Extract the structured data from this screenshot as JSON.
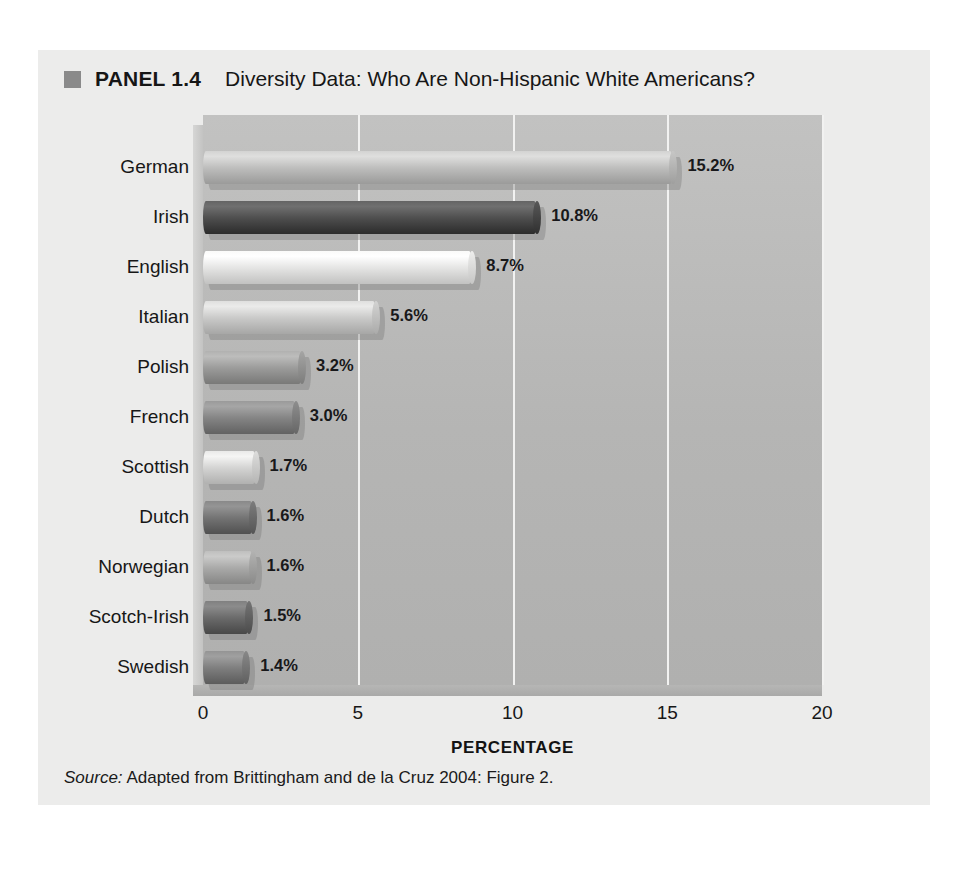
{
  "panel": {
    "bullet_icon": "square-bullet-icon",
    "label": "PANEL 1.4",
    "title": "Diversity Data: Who Are Non-Hispanic White Americans?",
    "source_prefix": "Source:",
    "source_text": " Adapted from Brittingham and de la Cruz 2004: Figure 2.",
    "background_color": "#ececeb",
    "bullet_color": "#8a8a8a"
  },
  "chart_data": {
    "type": "bar",
    "orientation": "horizontal",
    "title": "Diversity Data: Who Are Non-Hispanic White Americans?",
    "xlabel": "PERCENTAGE",
    "ylabel": "",
    "xlim": [
      0,
      20
    ],
    "xticks": [
      0,
      5,
      10,
      15,
      20
    ],
    "xtick_labels": [
      "0",
      "5",
      "10",
      "15",
      "20"
    ],
    "grid": true,
    "legend": "none",
    "value_suffix": "%",
    "categories": [
      "German",
      "Irish",
      "English",
      "Italian",
      "Polish",
      "French",
      "Scottish",
      "Dutch",
      "Norwegian",
      "Scotch-Irish",
      "Swedish"
    ],
    "values": [
      15.2,
      10.8,
      8.7,
      5.6,
      3.2,
      3.0,
      1.7,
      1.6,
      1.6,
      1.5,
      1.4
    ],
    "value_labels": [
      "15.2%",
      "10.8%",
      "8.7%",
      "5.6%",
      "3.2%",
      "3.0%",
      "1.7%",
      "1.6%",
      "1.6%",
      "1.5%",
      "1.4%"
    ],
    "bar_colors": [
      "#bdbdbc",
      "#4e4e4e",
      "#e4e4e3",
      "#c9c9c8",
      "#9b9b9a",
      "#848484",
      "#d3d3d2",
      "#737373",
      "#a9a9a8",
      "#6a6a6a",
      "#7e7e7e"
    ],
    "plot_background": "#b8b8b7",
    "gridline_color": "#f2f2f1"
  }
}
